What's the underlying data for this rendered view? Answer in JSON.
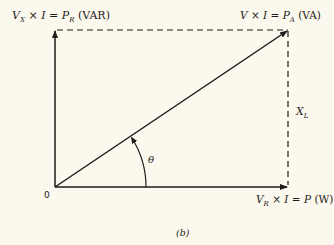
{
  "diagram": {
    "type": "power-triangle-phasor",
    "caption": "(b)",
    "colors": {
      "background": "#fbf8ee",
      "ink": "#1f1b18"
    },
    "origin_label": "0",
    "angle_label": "θ",
    "vertical_axis_label": {
      "v": "V",
      "v_sub": "X",
      "times": " × ",
      "i": "I",
      "eq": " = ",
      "p": "P",
      "p_sub": "R",
      "unit": " (VAR)"
    },
    "hypotenuse_label": {
      "v": "V",
      "times": " × ",
      "i": "I",
      "eq": " = ",
      "p": "P",
      "p_sub": "A",
      "unit": " (VA)"
    },
    "horizontal_axis_label": {
      "v": "V",
      "v_sub": "R",
      "times": " × ",
      "i": "I",
      "eq": " = ",
      "p": "P",
      "unit": " (W)"
    },
    "side_label": {
      "x": "X",
      "x_sub": "L"
    },
    "geometry": {
      "origin": [
        55,
        187
      ],
      "top_left": [
        55,
        30
      ],
      "top_right": [
        288,
        30
      ],
      "bottom_right": [
        288,
        187
      ],
      "arc_radius": 91
    }
  }
}
